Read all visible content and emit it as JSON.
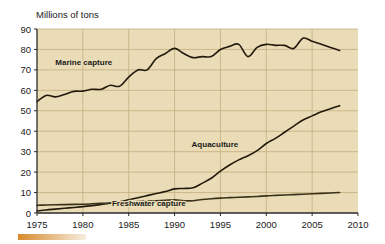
{
  "chart_data": {
    "type": "line",
    "title": "",
    "subtitle": "",
    "ylabel": "Millions of tons",
    "xlabel": "",
    "xlim": [
      1975,
      2010
    ],
    "ylim": [
      0,
      90
    ],
    "xticks": [
      1975,
      1980,
      1985,
      1990,
      1995,
      2000,
      2005,
      2010
    ],
    "yticks": [
      0,
      10,
      20,
      30,
      40,
      50,
      60,
      70,
      80,
      90
    ],
    "grid": true,
    "legend_position": "inline-annotations",
    "series": [
      {
        "name": "Marine capture",
        "color": "#231a0d",
        "label_x": 1980.1,
        "label_y": 72.5,
        "x": [
          1975,
          1976,
          1977,
          1978,
          1979,
          1980,
          1981,
          1982,
          1983,
          1984,
          1985,
          1986,
          1987,
          1988,
          1989,
          1990,
          1991,
          1992,
          1993,
          1994,
          1995,
          1996,
          1997,
          1998,
          1999,
          2000,
          2001,
          2002,
          2003,
          2004,
          2005,
          2006,
          2007,
          2008
        ],
        "values": [
          54.5,
          57.5,
          56.8,
          58.0,
          59.5,
          59.6,
          60.5,
          60.5,
          62.5,
          62.0,
          66.5,
          70.0,
          70.0,
          75.5,
          78.0,
          80.5,
          78.0,
          76.0,
          76.5,
          76.5,
          80.0,
          81.5,
          82.5,
          76.5,
          81.0,
          82.5,
          82.0,
          82.0,
          80.5,
          85.5,
          84.0,
          82.5,
          81.0,
          79.5
        ]
      },
      {
        "name": "Aquaculture",
        "color": "#231a0d",
        "label_x": 1994.4,
        "label_y": 32.5,
        "x": [
          1975,
          1976,
          1977,
          1978,
          1979,
          1980,
          1981,
          1982,
          1983,
          1984,
          1985,
          1986,
          1987,
          1988,
          1989,
          1990,
          1991,
          1992,
          1993,
          1994,
          1995,
          1996,
          1997,
          1998,
          1999,
          2000,
          2001,
          2002,
          2003,
          2004,
          2005,
          2006,
          2007,
          2008
        ],
        "values": [
          1.0,
          1.5,
          1.9,
          2.3,
          2.7,
          3.1,
          3.6,
          4.2,
          4.8,
          5.5,
          6.5,
          7.5,
          8.5,
          9.5,
          10.5,
          11.8,
          12.0,
          12.3,
          14.5,
          17.0,
          20.5,
          23.5,
          26.0,
          28.0,
          30.5,
          34.0,
          36.5,
          39.5,
          42.5,
          45.5,
          47.5,
          49.5,
          51.0,
          52.5
        ]
      },
      {
        "name": "Freshwater capture",
        "color": "#3a3219",
        "label_x": 1987.2,
        "label_y": 3.2,
        "x": [
          1975,
          1976,
          1977,
          1978,
          1979,
          1980,
          1981,
          1982,
          1983,
          1984,
          1985,
          1986,
          1987,
          1988,
          1989,
          1990,
          1991,
          1992,
          1993,
          1994,
          1995,
          1996,
          1997,
          1998,
          1999,
          2000,
          2001,
          2002,
          2003,
          2004,
          2005,
          2006,
          2007,
          2008
        ],
        "values": [
          3.8,
          3.9,
          4.0,
          4.1,
          4.2,
          4.3,
          4.5,
          4.7,
          4.9,
          5.1,
          5.4,
          5.6,
          5.8,
          6.0,
          6.2,
          6.4,
          6.0,
          6.0,
          6.6,
          7.0,
          7.3,
          7.5,
          7.7,
          7.9,
          8.1,
          8.4,
          8.6,
          8.8,
          9.0,
          9.2,
          9.4,
          9.6,
          9.8,
          10.0
        ]
      }
    ]
  },
  "decor": {
    "bottom_bar_color_left": "#d98a2b",
    "bottom_bar_color_right": "#f5ede0"
  }
}
